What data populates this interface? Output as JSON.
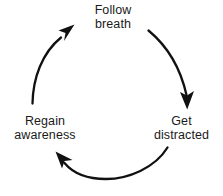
{
  "diagram": {
    "type": "circular-flow",
    "background_color": "#ffffff",
    "stroke_color": "#111111",
    "text_color": "#1a1a1a",
    "nodes": [
      {
        "id": "follow-breath",
        "position": "top",
        "line1": "Follow",
        "line2": "breath"
      },
      {
        "id": "get-distracted",
        "position": "bottom-right",
        "line1": "Get",
        "line2": "distracted"
      },
      {
        "id": "regain-awareness",
        "position": "bottom-left",
        "line1": "Regain",
        "line2": "awareness"
      }
    ],
    "arrows": [
      {
        "id": "arrow-follow-to-distracted",
        "from": "follow-breath",
        "to": "get-distracted",
        "direction": "clockwise-right-descending",
        "head": "down"
      },
      {
        "id": "arrow-distracted-to-regain",
        "from": "get-distracted",
        "to": "regain-awareness",
        "direction": "clockwise-bottom-leftward",
        "head": "up-left"
      },
      {
        "id": "arrow-regain-to-follow",
        "from": "regain-awareness",
        "to": "follow-breath",
        "direction": "clockwise-left-ascending",
        "head": "up-right"
      }
    ]
  }
}
